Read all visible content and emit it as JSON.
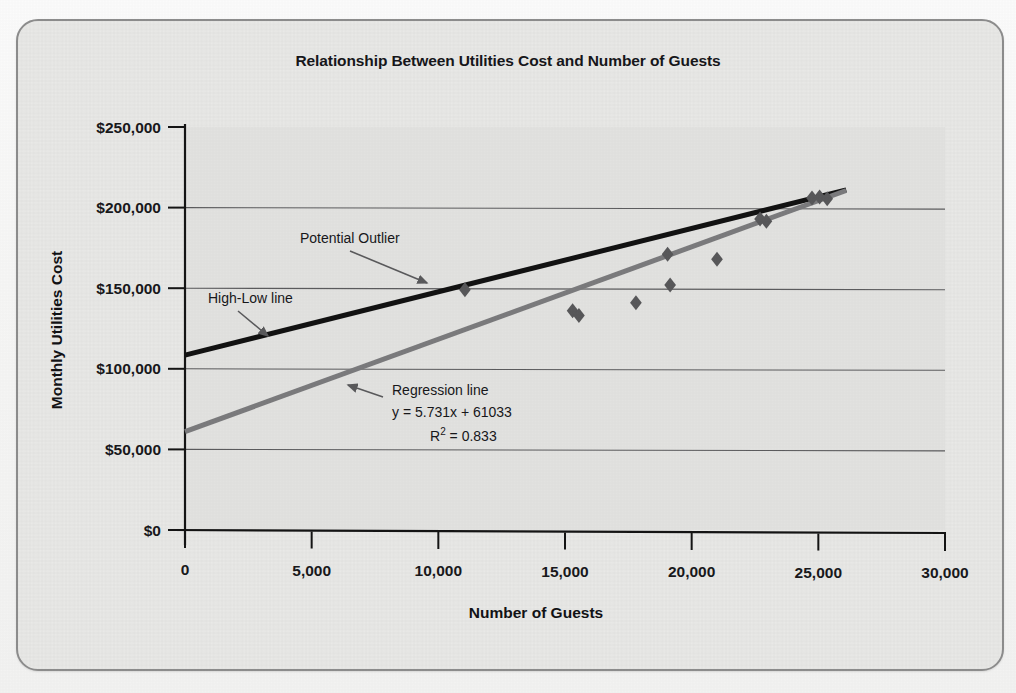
{
  "figure": {
    "title": "Relationship Between Utilities Cost and Number of Guests",
    "frame_color": "#8d8d8d",
    "plot_bg": "#e3e3e1"
  },
  "annotations": {
    "outlier_label": "Potential Outlier",
    "highlow_label": "High-Low line",
    "regression_label": "Regression line",
    "regression_equation": "y = 5.731x + 61033",
    "r_squared_prefix": "R",
    "r_squared_sup": "2",
    "r_squared_value": " = 0.833"
  },
  "chart_data": {
    "type": "scatter",
    "title": "Relationship Between Utilities Cost and Number of Guests",
    "xlabel": "Number of Guests",
    "ylabel": "Monthly Utilities Cost",
    "xlim": [
      0,
      30000
    ],
    "ylim": [
      0,
      250000
    ],
    "xticks": [
      0,
      5000,
      10000,
      15000,
      20000,
      25000,
      30000
    ],
    "xtick_labels": [
      "0",
      "5,000",
      "10,000",
      "15,000",
      "20,000",
      "25,000",
      "30,000"
    ],
    "yticks": [
      0,
      50000,
      100000,
      150000,
      200000,
      250000
    ],
    "ytick_labels": [
      "$0",
      "$50,000",
      "$100,000",
      "$150,000",
      "$200,000",
      "$250,000"
    ],
    "grid": "horizontal",
    "legend": "none",
    "marker": "diamond",
    "marker_color": "#58585a",
    "points": [
      {
        "x": 11050,
        "y": 149000,
        "note": "Potential Outlier"
      },
      {
        "x": 15300,
        "y": 136000
      },
      {
        "x": 15550,
        "y": 133000
      },
      {
        "x": 17800,
        "y": 141000
      },
      {
        "x": 19050,
        "y": 171000
      },
      {
        "x": 19150,
        "y": 152000
      },
      {
        "x": 21000,
        "y": 168000
      },
      {
        "x": 22700,
        "y": 193000
      },
      {
        "x": 22950,
        "y": 191500
      },
      {
        "x": 24750,
        "y": 206000
      },
      {
        "x": 25050,
        "y": 206500
      },
      {
        "x": 25350,
        "y": 205500
      }
    ],
    "series": [
      {
        "name": "High-Low line",
        "type": "line",
        "color": "#121212",
        "width": 5,
        "x": [
          0,
          26100
        ],
        "y": [
          108500,
          211000
        ]
      },
      {
        "name": "Regression line",
        "type": "line",
        "color": "#7b7b7d",
        "width": 5,
        "equation": "y = 5.731x + 61033",
        "r2": 0.833,
        "slope": 5.731,
        "intercept": 61033,
        "x": [
          0,
          26100
        ],
        "y": [
          61033,
          210620
        ]
      }
    ]
  }
}
